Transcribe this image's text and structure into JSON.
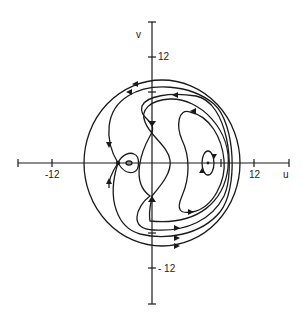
{
  "figure": {
    "axes": {
      "x_label": "u",
      "y_label": "v",
      "x_ticks": [
        {
          "value": -12,
          "label": "-12"
        },
        {
          "value": 12,
          "label": "12"
        }
      ],
      "y_ticks": [
        {
          "value": 12,
          "label": "12"
        },
        {
          "value": -12,
          "label": "- 12"
        }
      ]
    },
    "equilibria": [
      {
        "type": "saddle",
        "approx_u": -4
      },
      {
        "type": "center",
        "approx_u": -2.6,
        "note": "inside small loop"
      },
      {
        "type": "center",
        "approx_u": 6.6
      }
    ],
    "curves": [
      {
        "name": "outer-orbit",
        "direction": "counterclockwise-top-left / clockwise-bottom-right"
      },
      {
        "name": "second-orbit"
      },
      {
        "name": "third-orbit"
      },
      {
        "name": "separatrix-loop"
      },
      {
        "name": "crescent-orbit"
      },
      {
        "name": "inner-center-orbit"
      },
      {
        "name": "small-saddle-loop"
      }
    ],
    "colors": {
      "line": "#1a1a1a",
      "background": "#ffffff"
    }
  }
}
